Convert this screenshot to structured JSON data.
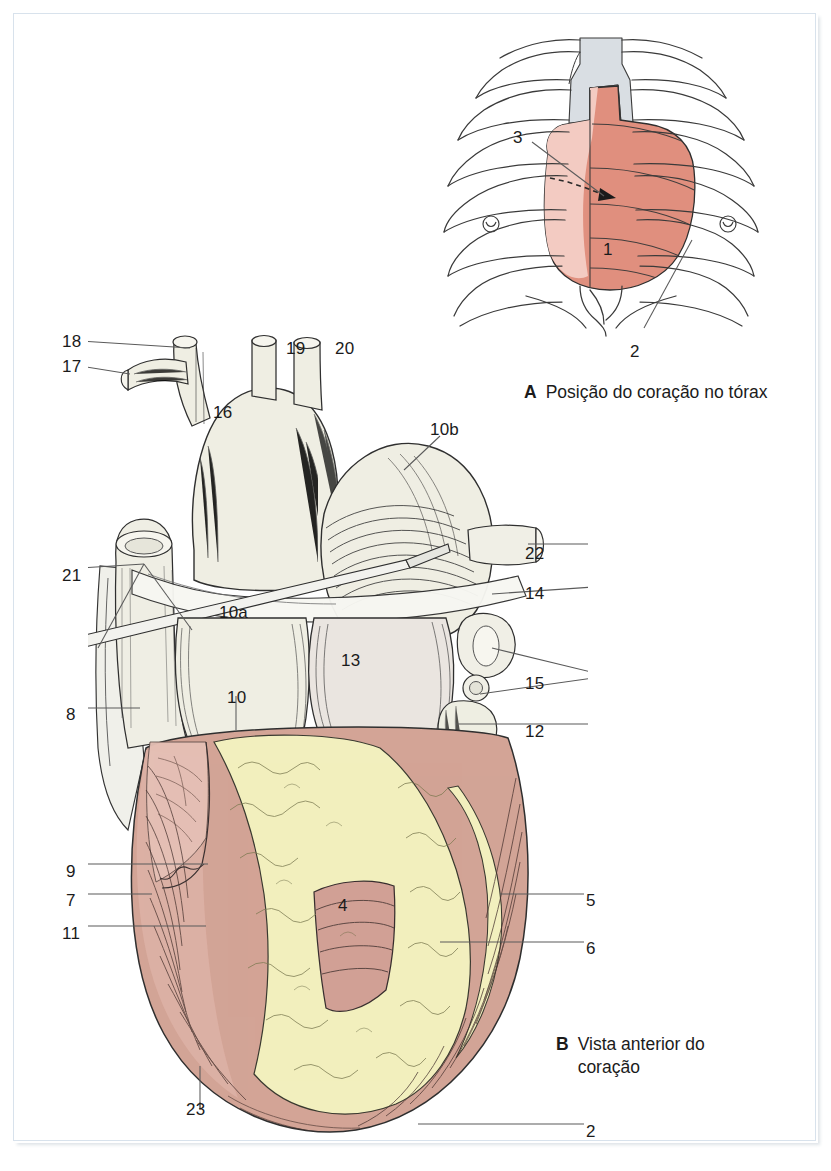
{
  "page": {
    "language": "pt-BR",
    "background": "#ffffff",
    "frame_color": "#d8e2ec"
  },
  "palette": {
    "heart_silhouette": "#e0907f",
    "heart_silhouette_light": "#f3cbc2",
    "mediastinum_grey": "#d8dde2",
    "myocardium_rose": "#d2a396",
    "myocardium_rose_light": "#e3bdb2",
    "epicardial_fat": "#f2efbe",
    "vessel_pale": "#eeeee2",
    "ink": "#1b1b1b",
    "leader_line": "#5a5a5a"
  },
  "figure_a": {
    "id": "A",
    "caption_letter": "A",
    "caption_text": "Posição do coração no tórax",
    "title_full": "A  Posição do coração no tórax",
    "description": "Contorno da caixa torácica com a silhueta do coração projetada",
    "labels": [
      {
        "id": "a-3",
        "text": "3",
        "x": 519,
        "y": 137
      },
      {
        "id": "a-1",
        "text": "1",
        "x": 607,
        "y": 249
      },
      {
        "id": "a-2",
        "text": "2",
        "x": 635,
        "y": 351
      }
    ]
  },
  "figure_b": {
    "id": "B",
    "caption_letter": "B",
    "caption_line1": "Vista anterior do",
    "caption_line2": "coração",
    "caption_text": "Vista anterior do coração",
    "title_full": "B  Vista anterior do coração",
    "description": "Coração em vista anterior com grandes vasos, gordura epicárdica e miocárdio",
    "labels": [
      {
        "id": "b-18",
        "text": "18",
        "x": 62,
        "y": 334
      },
      {
        "id": "b-17",
        "text": "17",
        "x": 62,
        "y": 359
      },
      {
        "id": "b-16",
        "text": "16",
        "x": 214,
        "y": 404
      },
      {
        "id": "b-19",
        "text": "19",
        "x": 288,
        "y": 340
      },
      {
        "id": "b-20",
        "text": "20",
        "x": 337,
        "y": 340
      },
      {
        "id": "b-10b",
        "text": "10b",
        "x": 432,
        "y": 422
      },
      {
        "id": "b-22",
        "text": "22",
        "x": 527,
        "y": 546
      },
      {
        "id": "b-14",
        "text": "14",
        "x": 527,
        "y": 586
      },
      {
        "id": "b-21",
        "text": "21",
        "x": 62,
        "y": 568
      },
      {
        "id": "b-10a",
        "text": "10a",
        "x": 222,
        "y": 605
      },
      {
        "id": "b-13",
        "text": "13",
        "x": 343,
        "y": 653
      },
      {
        "id": "b-15",
        "text": "15",
        "x": 527,
        "y": 676
      },
      {
        "id": "b-10",
        "text": "10",
        "x": 228,
        "y": 690
      },
      {
        "id": "b-8",
        "text": "8",
        "x": 66,
        "y": 707
      },
      {
        "id": "b-12",
        "text": "12",
        "x": 527,
        "y": 724
      },
      {
        "id": "b-9",
        "text": "9",
        "x": 66,
        "y": 864
      },
      {
        "id": "b-7",
        "text": "7",
        "x": 66,
        "y": 893
      },
      {
        "id": "b-5",
        "text": "5",
        "x": 588,
        "y": 893
      },
      {
        "id": "b-4",
        "text": "4",
        "x": 340,
        "y": 898
      },
      {
        "id": "b-11",
        "text": "11",
        "x": 62,
        "y": 926
      },
      {
        "id": "b-6",
        "text": "6",
        "x": 588,
        "y": 941
      },
      {
        "id": "b-23",
        "text": "23",
        "x": 188,
        "y": 1102
      },
      {
        "id": "b-2",
        "text": "2",
        "x": 588,
        "y": 1124
      }
    ]
  }
}
